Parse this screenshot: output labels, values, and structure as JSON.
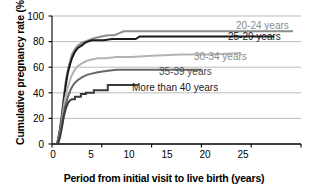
{
  "chart_data": {
    "type": "line",
    "title": "",
    "xlabel": "Period from initial visit to live birth (years)",
    "ylabel": "Cumulative pregnancy rate (%)",
    "xlim": [
      0,
      25
    ],
    "ylim": [
      0,
      100
    ],
    "xticks": [
      "0",
      "5",
      "10",
      "15",
      "20",
      "25"
    ],
    "yticks": [
      "0",
      "20",
      "40",
      "60",
      "80",
      "100"
    ],
    "grid": "horizontal",
    "legend_position": "inline-right-of-curve-ends",
    "series": [
      {
        "name": "20-24 years",
        "color": "#8c8c8c",
        "label_color": "#8c8c8c",
        "final_value": 88,
        "x_end": 24.2,
        "points": [
          [
            0.0,
            0
          ],
          [
            0.5,
            0
          ],
          [
            0.6,
            4
          ],
          [
            0.8,
            12
          ],
          [
            1.0,
            24
          ],
          [
            1.2,
            38
          ],
          [
            1.4,
            50
          ],
          [
            1.6,
            58
          ],
          [
            1.8,
            64
          ],
          [
            2.0,
            70
          ],
          [
            2.3,
            74
          ],
          [
            2.6,
            77
          ],
          [
            3.0,
            79
          ],
          [
            3.3,
            80
          ],
          [
            3.6,
            81
          ],
          [
            4.0,
            82
          ],
          [
            4.4,
            83
          ],
          [
            5.0,
            84
          ],
          [
            5.6,
            85
          ],
          [
            6.2,
            85
          ],
          [
            6.6,
            86
          ],
          [
            7.2,
            88
          ],
          [
            10.0,
            88
          ],
          [
            15.0,
            88
          ],
          [
            20.0,
            88
          ],
          [
            24.2,
            88
          ]
        ]
      },
      {
        "name": "25-29 years",
        "color": "#1a1a1a",
        "label_color": "#1a1a1a",
        "final_value": 84,
        "x_end": 22.3,
        "points": [
          [
            0.0,
            0
          ],
          [
            0.5,
            0
          ],
          [
            0.6,
            3
          ],
          [
            0.8,
            11
          ],
          [
            1.0,
            22
          ],
          [
            1.2,
            35
          ],
          [
            1.4,
            47
          ],
          [
            1.6,
            56
          ],
          [
            1.8,
            62
          ],
          [
            2.0,
            67
          ],
          [
            2.3,
            72
          ],
          [
            2.6,
            75
          ],
          [
            3.0,
            77
          ],
          [
            3.3,
            79
          ],
          [
            3.6,
            80
          ],
          [
            4.0,
            81
          ],
          [
            4.6,
            81
          ],
          [
            5.2,
            81
          ],
          [
            6.0,
            82
          ],
          [
            7.0,
            82
          ],
          [
            8.4,
            82
          ],
          [
            8.8,
            84
          ],
          [
            12.0,
            84
          ],
          [
            17.0,
            84
          ],
          [
            22.3,
            84
          ]
        ]
      },
      {
        "name": "30-34 years",
        "color": "#b3b3b3",
        "label_color": "#8c8c8c",
        "final_value": 71,
        "x_end": 19.0,
        "points": [
          [
            0.0,
            0
          ],
          [
            0.5,
            0
          ],
          [
            0.7,
            5
          ],
          [
            0.9,
            14
          ],
          [
            1.1,
            25
          ],
          [
            1.3,
            35
          ],
          [
            1.6,
            45
          ],
          [
            1.9,
            52
          ],
          [
            2.2,
            57
          ],
          [
            2.6,
            61
          ],
          [
            3.0,
            63
          ],
          [
            3.5,
            65
          ],
          [
            4.0,
            66
          ],
          [
            4.6,
            67
          ],
          [
            5.4,
            67
          ],
          [
            6.5,
            68
          ],
          [
            8.0,
            68
          ],
          [
            10.0,
            69
          ],
          [
            13.0,
            70
          ],
          [
            16.0,
            70
          ],
          [
            19.0,
            71
          ]
        ]
      },
      {
        "name": "35-39 years",
        "color": "#666666",
        "label_color": "#4d4d4d",
        "final_value": 58,
        "x_end": 15.0,
        "points": [
          [
            0.0,
            0
          ],
          [
            0.5,
            0
          ],
          [
            0.7,
            4
          ],
          [
            0.9,
            12
          ],
          [
            1.1,
            21
          ],
          [
            1.3,
            29
          ],
          [
            1.6,
            37
          ],
          [
            1.9,
            43
          ],
          [
            2.2,
            47
          ],
          [
            2.6,
            50
          ],
          [
            3.0,
            52
          ],
          [
            3.5,
            54
          ],
          [
            4.0,
            55
          ],
          [
            4.6,
            56
          ],
          [
            5.4,
            57
          ],
          [
            6.5,
            58
          ],
          [
            8.0,
            58
          ],
          [
            11.0,
            58
          ],
          [
            15.0,
            58
          ]
        ]
      },
      {
        "name": "More than 40 years",
        "color": "#3a3a3a",
        "label_color": "#1a1a1a",
        "final_value": 46,
        "x_end": 8.6,
        "points": [
          [
            0.0,
            0
          ],
          [
            0.6,
            0
          ],
          [
            0.8,
            5
          ],
          [
            1.0,
            13
          ],
          [
            1.2,
            22
          ],
          [
            1.4,
            28
          ],
          [
            1.6,
            32
          ],
          [
            1.8,
            34
          ],
          [
            2.0,
            35
          ],
          [
            2.3,
            35
          ],
          [
            2.3,
            37
          ],
          [
            2.9,
            37
          ],
          [
            2.9,
            39
          ],
          [
            3.4,
            39
          ],
          [
            3.4,
            40
          ],
          [
            4.2,
            40
          ],
          [
            4.2,
            42
          ],
          [
            5.6,
            42
          ],
          [
            5.6,
            46
          ],
          [
            6.8,
            46
          ],
          [
            8.6,
            46
          ]
        ]
      }
    ]
  },
  "labels": {
    "series_labels": [
      {
        "text": "20-24 years",
        "left": 236,
        "top": 20,
        "color": "#8c8c8c"
      },
      {
        "text": "25-29 years",
        "left": 228,
        "top": 31,
        "color": "#1a1a1a"
      },
      {
        "text": "30-34 years",
        "left": 194,
        "top": 51,
        "color": "#8c8c8c"
      },
      {
        "text": "35-39 years",
        "left": 159,
        "top": 66,
        "color": "#4d4d4d"
      },
      {
        "text": "More than 40 years",
        "left": 132,
        "top": 82,
        "color": "#1a1a1a"
      }
    ],
    "y_ticks": [
      {
        "text": "100",
        "top": 11
      },
      {
        "text": "80",
        "top": 36
      },
      {
        "text": "60",
        "top": 62
      },
      {
        "text": "40",
        "top": 88
      },
      {
        "text": "20",
        "top": 113
      },
      {
        "text": "0",
        "top": 139
      }
    ],
    "x_ticks": [
      {
        "text": "0",
        "left": 41
      },
      {
        "text": "5",
        "left": 79
      },
      {
        "text": "10",
        "left": 117
      },
      {
        "text": "15",
        "left": 155
      },
      {
        "text": "20",
        "left": 193
      },
      {
        "text": "25",
        "left": 231
      }
    ]
  }
}
